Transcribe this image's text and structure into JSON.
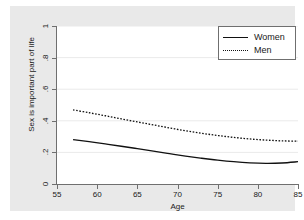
{
  "chart_data": {
    "type": "line",
    "title": "",
    "xlabel": "Age",
    "ylabel": "Sex is important part of life",
    "xlim": [
      55,
      85
    ],
    "ylim": [
      0,
      1
    ],
    "xticks": [
      "55",
      "60",
      "65",
      "70",
      "75",
      "80",
      "85"
    ],
    "yticks": [
      "0",
      ".2",
      ".4",
      ".6",
      ".8",
      "1"
    ],
    "grid": "horizontal",
    "legend_position": "top-right",
    "series": [
      {
        "name": "Women",
        "style": "solid",
        "color": "#111111",
        "x": [
          57,
          59,
          61,
          63,
          65,
          67,
          69,
          71,
          73,
          75,
          77,
          79,
          81,
          83,
          85
        ],
        "values": [
          0.281,
          0.268,
          0.254,
          0.239,
          0.224,
          0.208,
          0.192,
          0.177,
          0.163,
          0.151,
          0.141,
          0.134,
          0.131,
          0.133,
          0.141
        ]
      },
      {
        "name": "Men",
        "style": "dotted",
        "color": "#111111",
        "x": [
          57,
          59,
          61,
          63,
          65,
          67,
          69,
          71,
          73,
          75,
          77,
          79,
          81,
          83,
          85
        ],
        "values": [
          0.469,
          0.451,
          0.432,
          0.412,
          0.393,
          0.374,
          0.355,
          0.337,
          0.321,
          0.307,
          0.295,
          0.285,
          0.278,
          0.273,
          0.271
        ]
      }
    ]
  },
  "legend": {
    "entries": [
      {
        "label": "Women",
        "style": "solid"
      },
      {
        "label": "Men",
        "style": "dotted"
      }
    ]
  }
}
